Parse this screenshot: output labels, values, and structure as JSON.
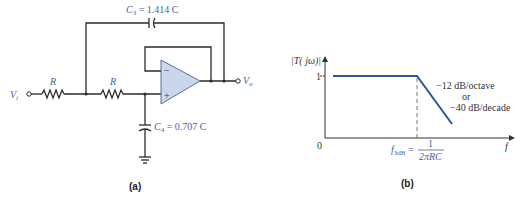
{
  "figure_a": {
    "caption": "(a)",
    "labels": {
      "vi": "V",
      "vi_sub": "i",
      "vo": "V",
      "vo_sub": "o",
      "r1": "R",
      "r2": "R",
      "c3": "C",
      "c3_sub": "3",
      "c3_value": " = 1.414 C",
      "c4": "C",
      "c4_sub": "4",
      "c4_value": " = 0.707 C",
      "opamp_minus": "−",
      "opamp_plus": "+"
    },
    "colors": {
      "label_blue": "#4a5ea8",
      "opamp_fill": "#c9d7ec",
      "wire": "#2b2b2b"
    }
  },
  "figure_b": {
    "caption": "(b)",
    "y_axis_label": "|T( jω)|",
    "x_axis_label": "f",
    "origin_label": "0",
    "y_tick_label": "1",
    "cutoff_label": "f",
    "cutoff_sub": "3dB",
    "cutoff_eq": " = ",
    "cutoff_num": "1",
    "cutoff_den": "2πRC",
    "slope_line1": "−12 dB/octave",
    "slope_line2": "or",
    "slope_line3": "−40 dB/decade",
    "colors": {
      "curve": "#2f5597",
      "label_blue": "#4a5ea8"
    }
  }
}
